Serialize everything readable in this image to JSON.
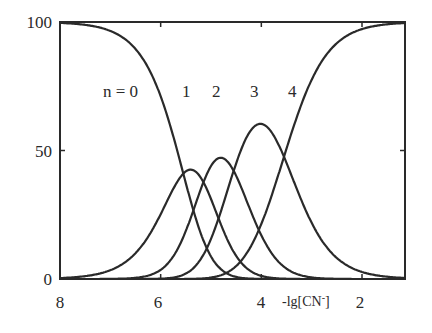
{
  "chart_data": {
    "type": "line",
    "title": "",
    "xlabel": "-lg[CN-]",
    "xlabel_parts": {
      "main": "-lg[CN",
      "sup": "-",
      "close": "]"
    },
    "ylabel": "",
    "xlim": [
      8,
      1.15
    ],
    "ylim": [
      0,
      100
    ],
    "x_ticks": [
      8,
      6,
      4,
      2
    ],
    "x_tick_labels": [
      "8",
      "6",
      "4",
      "2"
    ],
    "y_ticks": [
      0,
      50,
      100
    ],
    "y_tick_labels": [
      "0",
      "50",
      "100"
    ],
    "grid": false,
    "legend": "inline labels above curves",
    "series_labels": [
      "n = 0",
      "1",
      "2",
      "3",
      "4"
    ],
    "model_lgK_stepwise": [
      5.55,
      5.15,
      4.55,
      3.55
    ],
    "x": [
      8.0,
      7.5,
      7.0,
      6.5,
      6.0,
      5.75,
      5.5,
      5.25,
      5.0,
      4.75,
      4.5,
      4.25,
      4.0,
      3.75,
      3.5,
      3.25,
      3.0,
      2.5,
      2.0,
      1.5,
      1.15
    ],
    "series": [
      {
        "name": "n = 0",
        "values": [
          100,
          99,
          97,
          88,
          68,
          54,
          39,
          24,
          12,
          5,
          1.7,
          0.5,
          0.1,
          0,
          0,
          0,
          0,
          0,
          0,
          0,
          0
        ]
      },
      {
        "name": "1",
        "values": [
          0,
          1,
          3,
          11,
          28,
          35,
          39,
          38,
          31,
          21,
          11,
          5,
          1.6,
          0.4,
          0.1,
          0,
          0,
          0,
          0,
          0,
          0
        ]
      },
      {
        "name": "2",
        "values": [
          0,
          0,
          0,
          1,
          4,
          9,
          17,
          28,
          38,
          43,
          40,
          29,
          16,
          7,
          2.5,
          0.8,
          0.2,
          0,
          0,
          0,
          0
        ]
      },
      {
        "name": "3",
        "values": [
          0,
          0,
          0,
          0,
          0,
          1,
          4,
          9,
          17,
          27,
          41,
          53,
          61,
          55,
          41,
          25,
          13,
          3,
          0.4,
          0,
          0
        ]
      },
      {
        "name": "4",
        "values": [
          0,
          0,
          0,
          0,
          0,
          0,
          0.5,
          1,
          2,
          4,
          8,
          13,
          22,
          38,
          56,
          75,
          87,
          97,
          99.5,
          100,
          100
        ]
      }
    ]
  }
}
